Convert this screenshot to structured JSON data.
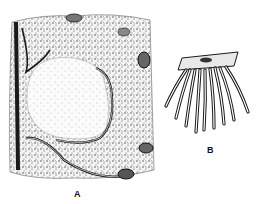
{
  "figure": {
    "panels": [
      {
        "id": "A",
        "label": "A",
        "description": "tissue section drawing with large pale central mass surrounded by stippled tissue and curving ducts"
      },
      {
        "id": "B",
        "label": "B",
        "description": "cluster of branching tubules hanging from a flat plate"
      }
    ],
    "colors": {
      "ink": "#1a1a1a",
      "background": "#ffffff",
      "stipple": "#555555"
    }
  }
}
